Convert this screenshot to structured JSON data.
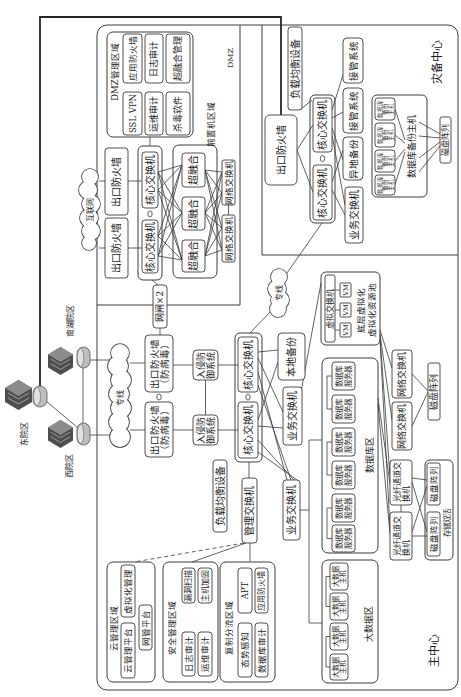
{
  "sites": {
    "east_campus": "东院区",
    "west_campus": "西院区",
    "nanhu_campus": "南湖院区"
  },
  "links": {
    "internet": "互联网",
    "leased_line_main": "专线",
    "leased_line_dr": "专线"
  },
  "main_center": {
    "label": "主中心",
    "dmz": {
      "label": "DMZ",
      "mgmt_zone": {
        "label": "DMZ管理区域",
        "items": [
          "应用防火墙",
          "SSL VPN",
          "日志审计",
          "运维审计",
          "超融合管理",
          "杀毒软件"
        ]
      },
      "egress_firewalls": [
        "出口防火墙",
        "出口防火墙"
      ],
      "core_switches": [
        "核心交换机",
        "核心交换机"
      ],
      "frontend_zone": {
        "label": "前置机区域",
        "hci_nodes": [
          "超融合",
          "超融合",
          "超融合"
        ]
      },
      "network_switches": [
        "网络交换机",
        "网络交换机"
      ]
    },
    "gatekeeper": "网闸×2",
    "edge_firewalls": [
      [
        "出口防火墙",
        "（防病毒）"
      ],
      [
        "出口防火墙",
        "（防病毒）"
      ]
    ],
    "ips": [
      [
        "入侵防",
        "御系统"
      ],
      [
        "入侵防",
        "御系统"
      ]
    ],
    "core_switches": [
      "核心交换机",
      "核心交换机"
    ],
    "local_backup": "本地备份",
    "business_switches": [
      "业务交换机",
      "业务交换机"
    ],
    "load_balancer": "负载均衡设备",
    "mgmt_switch": "管理交换机",
    "cloud_mgmt_zone": {
      "label": "云管理区域",
      "items": [
        "虚拟化管理",
        "云管理平台",
        "网管平台"
      ]
    },
    "security_mgmt_zone": {
      "label": "安全管理区域",
      "items": [
        "漏洞扫描",
        "主机加固",
        "日志审计",
        "运维审计"
      ]
    },
    "mirror_zone": {
      "label": "复制分流区域",
      "items": [
        "APT",
        "应用防火墙",
        "态势感知",
        "数据库审计"
      ]
    },
    "virtualization_pool": {
      "label": [
        "底层虚拟化",
        "虚拟化资源池"
      ],
      "vswitch": "虚拟交换机",
      "vms": [
        "VM",
        "VM",
        "VM"
      ]
    },
    "database_zone": {
      "label": "数据库区",
      "servers": [
        [
          "数据库",
          "服务器"
        ],
        [
          "数据库",
          "服务器"
        ],
        [
          "数据库",
          "服务器"
        ],
        [
          "数据库",
          "服务器"
        ],
        [
          "数据库",
          "服务器"
        ],
        [
          "数据库",
          "服务器"
        ]
      ]
    },
    "bigdata_zone": {
      "label": "大数据区",
      "hosts": [
        [
          "大数据",
          "主机"
        ],
        [
          "大数据",
          "主机"
        ],
        [
          "大数据",
          "主机"
        ],
        [
          "大数据",
          "主机"
        ]
      ]
    },
    "storage_network_switches": [
      "网络交换机",
      "网络交换机"
    ],
    "disk_array": "磁盘阵列",
    "fc_switches": [
      [
        "光纤通道交",
        "换机"
      ],
      [
        "光纤通道交",
        "换机"
      ]
    ],
    "active_active_storage": {
      "label": "存储双活",
      "disk_arrays": [
        "磁盘阵列",
        "磁盘阵列"
      ]
    }
  },
  "dr_center": {
    "label": "灾备中心",
    "load_balancer": "负载均衡设备",
    "egress_firewall": "出口防火墙",
    "core_switches": [
      "核心交换机",
      "核心交换机"
    ],
    "takeover_systems": [
      "接管系统",
      "接管系统"
    ],
    "offsite_backup": "异地备份",
    "business_switch": "业务交换机",
    "db_backup": {
      "label": "数据库备份主机",
      "hosts": [
        [
          "数据库",
          "备份",
          "主机"
        ],
        [
          "数据库",
          "备份",
          "主机"
        ],
        [
          "数据库",
          "备份",
          "主机"
        ],
        [
          "数据库",
          "备份",
          "主机"
        ]
      ]
    },
    "disk_array": "磁盘阵列"
  }
}
